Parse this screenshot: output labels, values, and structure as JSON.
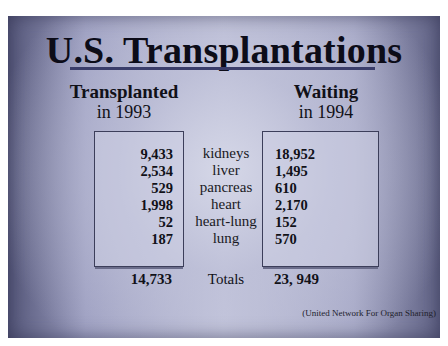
{
  "slide": {
    "title": "U.S. Transplantations",
    "left_header": {
      "line1": "Transplanted",
      "line2": "in 1993"
    },
    "right_header": {
      "line1": "Waiting",
      "line2": "in 1994"
    },
    "rows": [
      {
        "organ": "kidneys",
        "transplanted": "9,433",
        "waiting": "18,952"
      },
      {
        "organ": "liver",
        "transplanted": "2,534",
        "waiting": "1,495"
      },
      {
        "organ": "pancreas",
        "transplanted": "529",
        "waiting": "610"
      },
      {
        "organ": "heart",
        "transplanted": "1,998",
        "waiting": "2,170"
      },
      {
        "organ": "heart-lung",
        "transplanted": "52",
        "waiting": "152"
      },
      {
        "organ": "lung",
        "transplanted": "187",
        "waiting": "570"
      }
    ],
    "totals": {
      "label": "Totals",
      "transplanted": "14,733",
      "waiting": "23, 949"
    },
    "source": "(United Network For Organ Sharing)"
  }
}
